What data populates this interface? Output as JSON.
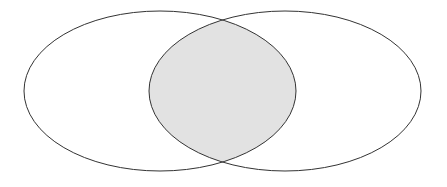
{
  "diagram": {
    "type": "venn",
    "sets": [
      {
        "id": "left",
        "cx": 160,
        "cy": 91,
        "rx": 136,
        "ry": 80
      },
      {
        "id": "right",
        "cx": 285,
        "cy": 91,
        "rx": 136,
        "ry": 80
      }
    ],
    "intersection_fill": "#e2e2e2",
    "stroke_color": "#333333",
    "background": "#ffffff"
  }
}
